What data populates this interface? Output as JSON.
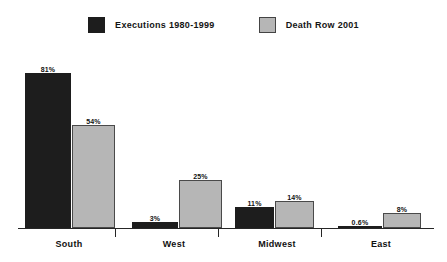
{
  "chart_data": {
    "type": "bar",
    "title": "",
    "subtitle": "",
    "xlabel": "",
    "ylabel": "",
    "ylim": [
      0,
      90
    ],
    "grid": false,
    "legend_position": "top-center",
    "categories": [
      "South",
      "West",
      "Midwest",
      "East"
    ],
    "series": [
      {
        "name": "Executions 1980-1999",
        "color": "#1d1d1d",
        "values": [
          81,
          3,
          11,
          0.6
        ],
        "labels": [
          "81%",
          "3%",
          "11%",
          "0.6%"
        ]
      },
      {
        "name": "Death Row 2001",
        "color": "#b6b6b6",
        "values": [
          54,
          25,
          14,
          8
        ],
        "labels": [
          "54%",
          "25%",
          "14%",
          "8%"
        ]
      }
    ]
  },
  "legend": {
    "items": [
      {
        "label": "Executions 1980-1999",
        "swatch": "dark-square-swatch"
      },
      {
        "label": "Death Row 2001",
        "swatch": "light-square-swatch"
      }
    ]
  },
  "axis": {
    "baseline": "category-axis",
    "ticks": [
      "tick-1",
      "tick-2",
      "tick-3"
    ]
  }
}
